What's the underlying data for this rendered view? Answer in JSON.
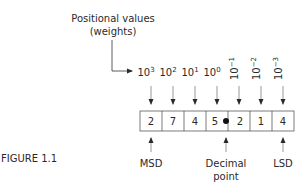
{
  "title_label": {
    "line1": "Positional values",
    "line2": "(weights)"
  },
  "weights": [
    {
      "base": "10",
      "exp": "3",
      "rotated": false
    },
    {
      "base": "10",
      "exp": "2",
      "rotated": false
    },
    {
      "base": "10",
      "exp": "1",
      "rotated": false
    },
    {
      "base": "10",
      "exp": "0",
      "rotated": false
    },
    {
      "base": "10",
      "exp": "−1",
      "rotated": true
    },
    {
      "base": "10",
      "exp": "−2",
      "rotated": true
    },
    {
      "base": "10",
      "exp": "−3",
      "rotated": true
    }
  ],
  "digits": [
    "2",
    "7",
    "4",
    "5",
    "2",
    "1",
    "4"
  ],
  "annotations": {
    "msd": "MSD",
    "decimal_line1": "Decimal",
    "decimal_line2": "point",
    "lsd": "LSD"
  },
  "caption": "FIGURE 1.1"
}
